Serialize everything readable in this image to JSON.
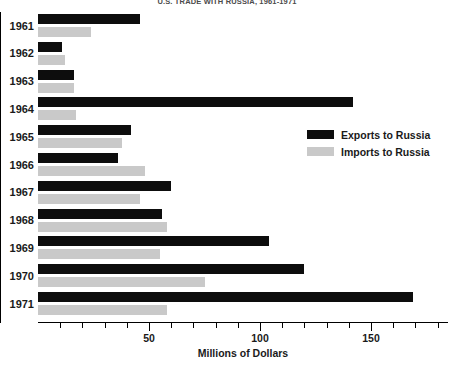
{
  "chart_data": {
    "type": "bar",
    "orientation": "horizontal",
    "title": "U.S. TRADE WITH RUSSIA, 1961-1971",
    "xlabel": "Millions of Dollars",
    "ylabel": "",
    "xlim": [
      0,
      185
    ],
    "ylim": null,
    "grid": false,
    "legend_position": "middle-right",
    "categories": [
      "1961",
      "1962",
      "1963",
      "1964",
      "1965",
      "1966",
      "1967",
      "1968",
      "1969",
      "1970",
      "1971"
    ],
    "series": [
      {
        "name": "Exports to Russia",
        "color": "#0d0d0d",
        "values": [
          46,
          11,
          16,
          142,
          42,
          36,
          60,
          56,
          104,
          120,
          169
        ]
      },
      {
        "name": "Imports to Russia",
        "color": "#c9c9c9",
        "values": [
          24,
          12,
          16,
          17,
          38,
          48,
          46,
          58,
          55,
          75,
          58
        ]
      }
    ],
    "x_ticks_major": [
      50,
      100,
      150
    ],
    "x_tick_labels": [
      "50",
      "100",
      "150"
    ],
    "x_ticks_minor": [
      10,
      20,
      30,
      40,
      60,
      70,
      80,
      90,
      110,
      120,
      130,
      140,
      160,
      170,
      180
    ]
  },
  "legend": {
    "items": [
      {
        "label": "Exports to Russia",
        "swatch": "exports"
      },
      {
        "label": "Imports to Russia",
        "swatch": "imports"
      }
    ]
  }
}
